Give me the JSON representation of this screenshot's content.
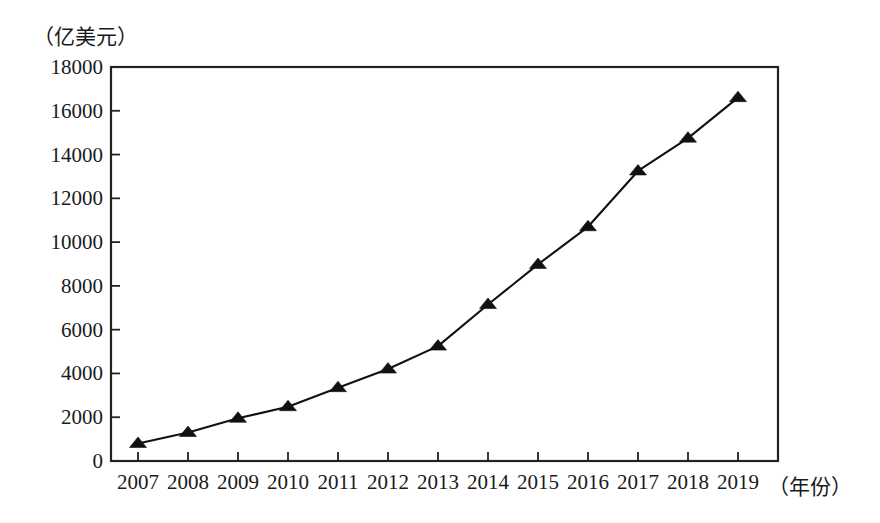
{
  "chart_data": {
    "type": "line",
    "title": "",
    "subtitle": "",
    "xlabel": "（年份）",
    "ylabel": "（亿美元）",
    "categories": [
      "2007",
      "2008",
      "2009",
      "2010",
      "2011",
      "2012",
      "2013",
      "2014",
      "2015",
      "2016",
      "2017",
      "2018",
      "2019"
    ],
    "x": [
      2007,
      2008,
      2009,
      2010,
      2011,
      2012,
      2013,
      2014,
      2015,
      2016,
      2017,
      2018,
      2019
    ],
    "values": [
      800,
      1300,
      1950,
      2480,
      3350,
      4200,
      5250,
      7150,
      8980,
      10700,
      13250,
      14750,
      16600
    ],
    "series": [
      {
        "name": "",
        "values": [
          800,
          1300,
          1950,
          2480,
          3350,
          4200,
          5250,
          7150,
          8980,
          10700,
          13250,
          14750,
          16600
        ]
      }
    ],
    "ylim": [
      0,
      18000
    ],
    "yticks": [
      0,
      2000,
      4000,
      6000,
      8000,
      10000,
      12000,
      14000,
      16000,
      18000
    ],
    "ytick_labels": [
      "0",
      "2000",
      "4000",
      "6000",
      "8000",
      "10000",
      "12000",
      "14000",
      "16000",
      "18000"
    ],
    "xtick_labels": [
      "2007",
      "2008",
      "2009",
      "2010",
      "2011",
      "2012",
      "2013",
      "2014",
      "2015",
      "2016",
      "2017",
      "2018",
      "2019"
    ],
    "grid": false,
    "legend": "none",
    "marker": "triangle",
    "line_color": "#111111",
    "marker_color": "#111111",
    "frame_color": "#222222"
  }
}
